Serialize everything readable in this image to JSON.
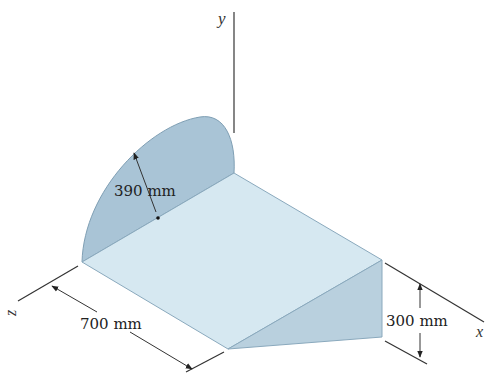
{
  "figure": {
    "axes": {
      "x": "x",
      "y": "y",
      "z": "z"
    },
    "dimensions": {
      "radius": "390 mm",
      "length": "700 mm",
      "height": "300 mm"
    },
    "colors": {
      "quarter_disk": "#a9c4d6",
      "top_face": "#d3e6f0",
      "side_triangle": "#b7cfde",
      "edge": "#7f9fb4",
      "line": "#333333"
    }
  }
}
